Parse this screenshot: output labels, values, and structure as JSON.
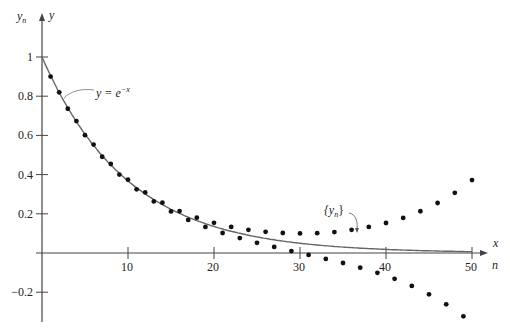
{
  "chart_data": {
    "type": "scatter",
    "title": "",
    "xlabel": "x / n",
    "ylabel": "y / y_n",
    "x_axis_labels": {
      "top": "x",
      "bottom": "n"
    },
    "y_axis_labels": {
      "left": "y_n",
      "right": "y"
    },
    "xlim": [
      0,
      52
    ],
    "ylim": [
      -0.33,
      1.05
    ],
    "x_ticks": [
      10,
      20,
      30,
      40,
      50
    ],
    "x_tick_labels": [
      "10",
      "20",
      "30",
      "40",
      "50"
    ],
    "y_ticks": [
      1,
      0.8,
      0.6,
      0.4,
      0.2,
      -0.2
    ],
    "y_tick_labels": [
      "1",
      "0.8",
      "0.6",
      "0.4",
      "0.2",
      "-0.2"
    ],
    "grid": false,
    "series": [
      {
        "name": "y = e^{-x}",
        "kind": "line",
        "annotation": "y = e^{-x}",
        "description": "exact solution curve, x = 0.1 n",
        "step": 0.1
      },
      {
        "name": "{y_n}",
        "kind": "points",
        "annotation": "{y_n}",
        "x": [
          1,
          2,
          3,
          4,
          5,
          6,
          7,
          8,
          9,
          10,
          11,
          12,
          13,
          14,
          15,
          16,
          17,
          18,
          19,
          20,
          21,
          22,
          23,
          24,
          25,
          26,
          27,
          28,
          29,
          30,
          31,
          32,
          33,
          34,
          35,
          36,
          37,
          38,
          39,
          40,
          41,
          42,
          43,
          44,
          45,
          46,
          47,
          48,
          49,
          50
        ],
        "values": [
          0.9,
          0.82,
          0.736,
          0.673,
          0.601,
          0.553,
          0.491,
          0.454,
          0.4,
          0.374,
          0.325,
          0.309,
          0.263,
          0.257,
          0.212,
          0.214,
          0.169,
          0.18,
          0.133,
          0.154,
          0.102,
          0.133,
          0.076,
          0.118,
          0.052,
          0.108,
          0.031,
          0.102,
          0.01,
          0.1,
          -0.01,
          0.101,
          -0.03,
          0.107,
          -0.051,
          0.118,
          -0.075,
          0.133,
          -0.101,
          0.153,
          -0.132,
          0.179,
          -0.168,
          0.213,
          -0.211,
          0.255,
          -0.262,
          0.307,
          -0.323,
          0.372
        ]
      }
    ]
  },
  "labels": {
    "y_n": "y",
    "y_n_sub": "n",
    "y": "y",
    "x": "x",
    "n": "n",
    "curve_eq_lhs": "y = e",
    "curve_eq_sup": "−x",
    "seq_open": "{y",
    "seq_sub": "n",
    "seq_close": "}"
  }
}
